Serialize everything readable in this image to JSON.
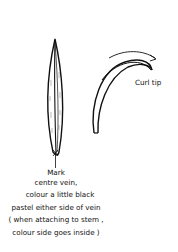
{
  "diagram": {
    "straight_leaf": {
      "description": "narrow pointed leaf with centre vein",
      "caption": [
        "Mark",
        "centre vein,",
        "colour a little black",
        "pastel either side of vein",
        "( when attaching to stem ,",
        "colour side goes inside )"
      ]
    },
    "curled_leaf": {
      "description": "leaf with curled tip and arrow",
      "label": "Curl tip"
    },
    "colors": {
      "ink": "#111111",
      "background": "#ffffff"
    }
  }
}
